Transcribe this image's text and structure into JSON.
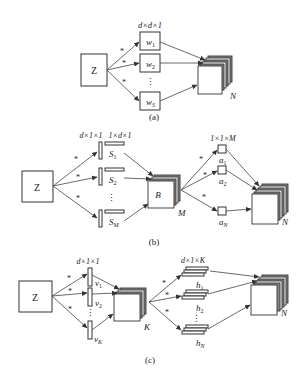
{
  "panels": {
    "a": {
      "caption": "(a)",
      "input_label": "Z",
      "filter_shape": "d×d×1",
      "filters": [
        {
          "base": "w",
          "sub": "1"
        },
        {
          "base": "w",
          "sub": "2"
        },
        {
          "base": "w",
          "sub": "S"
        }
      ],
      "conv_op": "*",
      "dots": "⋮",
      "output_label": "N"
    },
    "b": {
      "caption": "(b)",
      "input_label": "Z",
      "filter_shape_v": "d×1×1",
      "filter_shape_h": "1×d×1",
      "filters": [
        {
          "base": "S",
          "sub": "1"
        },
        {
          "base": "S",
          "sub": "2"
        },
        {
          "base": "S",
          "sub": "M"
        }
      ],
      "conv_op": "*",
      "dots": "⋮",
      "middle_label": "B",
      "middle_depth": "M",
      "pointwise_shape": "1×1×M",
      "pointwise": [
        {
          "base": "a",
          "sub": "1"
        },
        {
          "base": "a",
          "sub": "2"
        },
        {
          "base": "a",
          "sub": "N"
        }
      ],
      "output_label": "N"
    },
    "c": {
      "caption": "(c)",
      "input_label": "Z",
      "filter_shape": "d×1×1",
      "filters": [
        {
          "base": "v",
          "sub": "1"
        },
        {
          "base": "v",
          "sub": "2"
        },
        {
          "base": "v",
          "sub": "K"
        }
      ],
      "conv_op": "*",
      "dots": "⋮",
      "middle_depth": "K",
      "second_shape": "d×1×K",
      "second_filters": [
        {
          "base": "h",
          "sub": "1"
        },
        {
          "base": "h",
          "sub": "2"
        },
        {
          "base": "h",
          "sub": "N"
        }
      ],
      "output_label": "N"
    }
  }
}
